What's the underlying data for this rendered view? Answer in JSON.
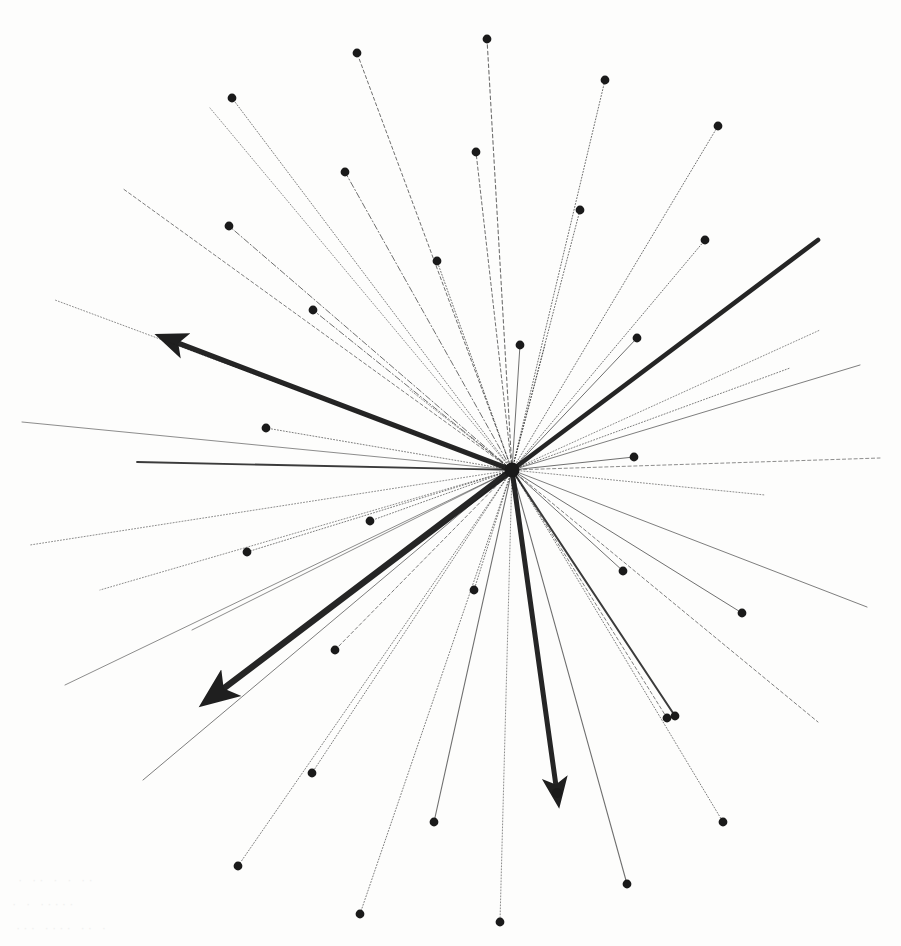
{
  "figure": {
    "background_color": "#fdfdfc",
    "ink_color": "#1a1a1a",
    "width": 901,
    "height": 946,
    "hub": {
      "label": "origin",
      "x": 512,
      "y": 470
    }
  },
  "chart_data": {
    "type": "scatter",
    "subtitle": "",
    "xlabel": "",
    "ylabel": "",
    "grid": false,
    "legend": "none",
    "xlim": [
      0,
      901
    ],
    "ylim": [
      0,
      946
    ],
    "origin": {
      "x": 512,
      "y": 470
    },
    "note": "Coordinates are in image pixel space; y increases downward. 'style' is the stroke dash pattern, 'w' the stroke width, 'dot' whether the ray terminates in a filled marker, 'arrow' whether it terminates in an arrowhead.",
    "rays": [
      {
        "id": "r01",
        "x": 357,
        "y": 53,
        "style": "dash",
        "w": 1.0,
        "dot": true,
        "arrow": false
      },
      {
        "id": "r02",
        "x": 487,
        "y": 39,
        "style": "dash",
        "w": 1.1,
        "dot": true,
        "arrow": false
      },
      {
        "id": "r03",
        "x": 605,
        "y": 80,
        "style": "dot",
        "w": 1.0,
        "dot": true,
        "arrow": false
      },
      {
        "id": "r04",
        "x": 718,
        "y": 126,
        "style": "dot",
        "w": 1.0,
        "dot": true,
        "arrow": false
      },
      {
        "id": "r05",
        "x": 232,
        "y": 98,
        "style": "dot",
        "w": 0.9,
        "dot": true,
        "arrow": false
      },
      {
        "id": "r06",
        "x": 345,
        "y": 172,
        "style": "dashdot",
        "w": 1.0,
        "dot": true,
        "arrow": false
      },
      {
        "id": "r07",
        "x": 476,
        "y": 152,
        "style": "dash",
        "w": 1.0,
        "dot": true,
        "arrow": false
      },
      {
        "id": "r08",
        "x": 580,
        "y": 210,
        "style": "dot",
        "w": 1.0,
        "dot": true,
        "arrow": false
      },
      {
        "id": "r09",
        "x": 705,
        "y": 240,
        "style": "dot",
        "w": 1.0,
        "dot": true,
        "arrow": false
      },
      {
        "id": "r10",
        "x": 229,
        "y": 226,
        "style": "dashdot",
        "w": 1.0,
        "dot": true,
        "arrow": false
      },
      {
        "id": "r11",
        "x": 313,
        "y": 310,
        "style": "dashdot",
        "w": 1.0,
        "dot": true,
        "arrow": false
      },
      {
        "id": "r12",
        "x": 437,
        "y": 261,
        "style": "dot",
        "w": 1.0,
        "dot": true,
        "arrow": false
      },
      {
        "id": "r13",
        "x": 637,
        "y": 338,
        "style": "solid",
        "w": 1.0,
        "dot": true,
        "arrow": false
      },
      {
        "id": "r14",
        "x": 818,
        "y": 240,
        "style": "solid",
        "w": 4.6,
        "dot": false,
        "arrow": false
      },
      {
        "id": "r15",
        "x": 520,
        "y": 345,
        "style": "solid",
        "w": 1.0,
        "dot": true,
        "arrow": false
      },
      {
        "id": "r16",
        "x": 122,
        "y": 188,
        "style": "dash",
        "w": 0.9,
        "dot": false,
        "arrow": false
      },
      {
        "id": "r17",
        "x": 266,
        "y": 428,
        "style": "dot",
        "w": 0.9,
        "dot": true,
        "arrow": false
      },
      {
        "id": "r18",
        "x": 170,
        "y": 340,
        "style": "solid",
        "w": 5.2,
        "dot": false,
        "arrow": true
      },
      {
        "id": "r19",
        "x": 55,
        "y": 300,
        "style": "dot",
        "w": 0.8,
        "dot": false,
        "arrow": false
      },
      {
        "id": "r20",
        "x": 22,
        "y": 422,
        "style": "solid",
        "w": 0.8,
        "dot": false,
        "arrow": false
      },
      {
        "id": "r21",
        "x": 137,
        "y": 462,
        "style": "solid",
        "w": 1.8,
        "dot": false,
        "arrow": false
      },
      {
        "id": "r22",
        "x": 790,
        "y": 368,
        "style": "dot",
        "w": 0.9,
        "dot": false,
        "arrow": false
      },
      {
        "id": "r23",
        "x": 860,
        "y": 365,
        "style": "solid",
        "w": 0.9,
        "dot": false,
        "arrow": false
      },
      {
        "id": "r24",
        "x": 634,
        "y": 457,
        "style": "solid",
        "w": 1.0,
        "dot": true,
        "arrow": false
      },
      {
        "id": "r25",
        "x": 880,
        "y": 458,
        "style": "dash",
        "w": 0.8,
        "dot": false,
        "arrow": false
      },
      {
        "id": "r26",
        "x": 765,
        "y": 495,
        "style": "dot",
        "w": 0.8,
        "dot": false,
        "arrow": false
      },
      {
        "id": "r27",
        "x": 247,
        "y": 552,
        "style": "dot",
        "w": 0.9,
        "dot": true,
        "arrow": false
      },
      {
        "id": "r28",
        "x": 370,
        "y": 521,
        "style": "dot",
        "w": 0.9,
        "dot": true,
        "arrow": false
      },
      {
        "id": "r29",
        "x": 30,
        "y": 545,
        "style": "dot",
        "w": 0.8,
        "dot": false,
        "arrow": false
      },
      {
        "id": "r30",
        "x": 100,
        "y": 590,
        "style": "dot",
        "w": 0.8,
        "dot": false,
        "arrow": false
      },
      {
        "id": "r31",
        "x": 192,
        "y": 630,
        "style": "solid",
        "w": 0.8,
        "dot": false,
        "arrow": false
      },
      {
        "id": "r32",
        "x": 65,
        "y": 685,
        "style": "solid",
        "w": 0.8,
        "dot": false,
        "arrow": false
      },
      {
        "id": "r33",
        "x": 215,
        "y": 695,
        "style": "solid",
        "w": 6.4,
        "dot": false,
        "arrow": true
      },
      {
        "id": "r34",
        "x": 335,
        "y": 650,
        "style": "dash",
        "w": 0.9,
        "dot": true,
        "arrow": false
      },
      {
        "id": "r35",
        "x": 143,
        "y": 780,
        "style": "solid",
        "w": 0.9,
        "dot": false,
        "arrow": false
      },
      {
        "id": "r36",
        "x": 238,
        "y": 866,
        "style": "dot",
        "w": 0.9,
        "dot": true,
        "arrow": false
      },
      {
        "id": "r37",
        "x": 312,
        "y": 773,
        "style": "dot",
        "w": 0.9,
        "dot": true,
        "arrow": false
      },
      {
        "id": "r38",
        "x": 360,
        "y": 914,
        "style": "dot",
        "w": 0.9,
        "dot": true,
        "arrow": false
      },
      {
        "id": "r39",
        "x": 434,
        "y": 822,
        "style": "solid",
        "w": 1.1,
        "dot": true,
        "arrow": false
      },
      {
        "id": "r40",
        "x": 500,
        "y": 922,
        "style": "dot",
        "w": 0.8,
        "dot": true,
        "arrow": false
      },
      {
        "id": "r41",
        "x": 557,
        "y": 793,
        "style": "solid",
        "w": 5.0,
        "dot": true,
        "arrow": true
      },
      {
        "id": "r42",
        "x": 627,
        "y": 884,
        "style": "solid",
        "w": 1.1,
        "dot": true,
        "arrow": false
      },
      {
        "id": "r43",
        "x": 675,
        "y": 716,
        "style": "solid",
        "w": 2.0,
        "dot": true,
        "arrow": false
      },
      {
        "id": "r44",
        "x": 667,
        "y": 718,
        "style": "dash",
        "w": 0.9,
        "dot": true,
        "arrow": false
      },
      {
        "id": "r45",
        "x": 742,
        "y": 613,
        "style": "solid",
        "w": 1.0,
        "dot": true,
        "arrow": false
      },
      {
        "id": "r46",
        "x": 623,
        "y": 571,
        "style": "solid",
        "w": 1.0,
        "dot": true,
        "arrow": false
      },
      {
        "id": "r47",
        "x": 818,
        "y": 722,
        "style": "dash",
        "w": 0.9,
        "dot": false,
        "arrow": false
      },
      {
        "id": "r48",
        "x": 867,
        "y": 607,
        "style": "solid",
        "w": 0.9,
        "dot": false,
        "arrow": false
      },
      {
        "id": "r49",
        "x": 723,
        "y": 822,
        "style": "dot",
        "w": 0.9,
        "dot": true,
        "arrow": false
      },
      {
        "id": "r50",
        "x": 545,
        "y": 345,
        "style": "dot",
        "w": 0.8,
        "dot": false,
        "arrow": false
      },
      {
        "id": "r51",
        "x": 410,
        "y": 390,
        "style": "dot",
        "w": 0.8,
        "dot": false,
        "arrow": false
      },
      {
        "id": "r52",
        "x": 474,
        "y": 590,
        "style": "dot",
        "w": 0.9,
        "dot": true,
        "arrow": false
      },
      {
        "id": "r53",
        "x": 210,
        "y": 108,
        "style": "dot",
        "w": 0.8,
        "dot": false,
        "arrow": false
      },
      {
        "id": "r54",
        "x": 820,
        "y": 330,
        "style": "dot",
        "w": 0.8,
        "dot": false,
        "arrow": false
      }
    ],
    "highlighted_arrows": [
      {
        "id": "a-nw",
        "direction": "northwest",
        "x": 170,
        "y": 340,
        "weight": "heavy"
      },
      {
        "id": "a-sw",
        "direction": "southwest",
        "x": 215,
        "y": 695,
        "weight": "heaviest"
      },
      {
        "id": "a-s",
        "direction": "south",
        "x": 557,
        "y": 793,
        "weight": "heavy"
      },
      {
        "id": "a-ne",
        "direction": "northeast",
        "x": 818,
        "y": 240,
        "weight": "heavy"
      }
    ]
  },
  "paper": {
    "ghost_marks": [
      "·  ··   ·    ·  ··",
      "·     ·   ·····",
      "··· ····   ··   ·"
    ]
  }
}
